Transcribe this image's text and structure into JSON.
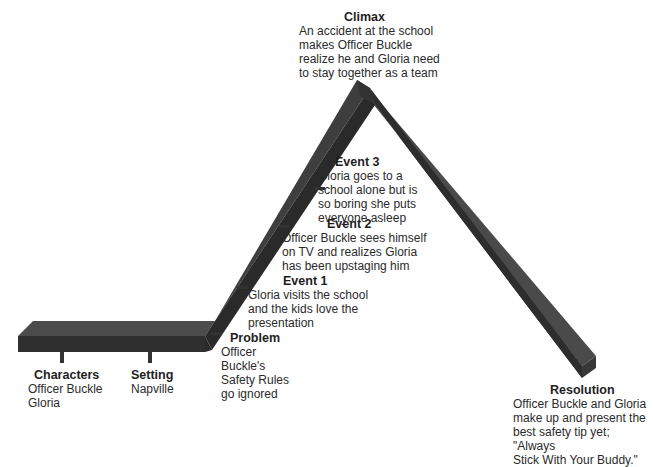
{
  "diagram": {
    "type": "plot-diagram",
    "stages": {
      "characters": {
        "title": "Characters",
        "text": "Officer Buckle\nGloria"
      },
      "setting": {
        "title": "Setting",
        "text": "Napville"
      },
      "problem": {
        "title": "Problem",
        "text": "Officer\nBuckle's\nSafety Rules\ngo ignored"
      },
      "event1": {
        "title": "Event 1",
        "text": "Gloria visits the school\nand the kids love the\npresentation"
      },
      "event2": {
        "title": "Event 2",
        "text": "Officer Buckle sees himself\non TV and realizes Gloria\nhas been upstaging him"
      },
      "event3": {
        "title": "Event 3",
        "text": "Gloria goes to a\nschool alone but is\nso boring she puts\neveryone asleep"
      },
      "climax": {
        "title": "Climax",
        "text": "An accident at the school\nmakes Officer Buckle\nrealize he and Gloria need\nto stay together as a team"
      },
      "resolution": {
        "title": "Resolution",
        "text": "Officer Buckle and Gloria\nmake up and present the\nbest safety tip yet; \"Always\nStick With Your Buddy.\""
      }
    },
    "colors": {
      "beam_top": "#4a4a4a",
      "beam_front": "#2e2e2e",
      "beam_side": "#3a3a3a",
      "peg": "#333333"
    }
  }
}
